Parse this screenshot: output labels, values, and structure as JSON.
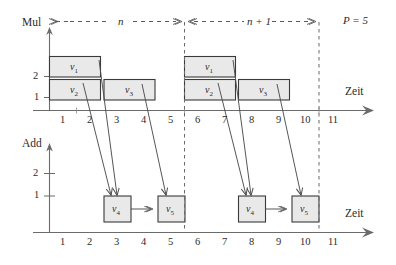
{
  "figure": {
    "title_annotation": "P = 5",
    "time_axis_label": "Zeit",
    "charts": [
      {
        "name": "mul",
        "axis_label": "Mul",
        "y_ticks": [
          "1",
          "2"
        ],
        "x_ticks": [
          "1",
          "2",
          "3",
          "4",
          "5",
          "6",
          "7",
          "8",
          "9",
          "10",
          "11"
        ],
        "blocks": [
          {
            "id": "v1a",
            "label": "v",
            "sub": "1",
            "start": 0,
            "end": 2,
            "row": 2
          },
          {
            "id": "v2a",
            "label": "v",
            "sub": "2",
            "start": 0,
            "end": 2,
            "row": 1
          },
          {
            "id": "v3a",
            "label": "v",
            "sub": "3",
            "start": 2,
            "end": 4,
            "row": 1
          },
          {
            "id": "v1b",
            "label": "v",
            "sub": "1",
            "start": 5,
            "end": 7,
            "row": 2
          },
          {
            "id": "v2b",
            "label": "v",
            "sub": "2",
            "start": 5,
            "end": 7,
            "row": 1
          },
          {
            "id": "v3b",
            "label": "v",
            "sub": "3",
            "start": 7,
            "end": 9,
            "row": 1
          }
        ]
      },
      {
        "name": "add",
        "axis_label": "Add",
        "y_ticks": [
          "1",
          "2"
        ],
        "x_ticks": [
          "1",
          "2",
          "3",
          "4",
          "5",
          "6",
          "7",
          "8",
          "9",
          "10",
          "11"
        ],
        "blocks": [
          {
            "id": "v4a",
            "label": "v",
            "sub": "4",
            "start": 2,
            "end": 3,
            "row": 1
          },
          {
            "id": "v5a",
            "label": "v",
            "sub": "5",
            "start": 4,
            "end": 5,
            "row": 1
          },
          {
            "id": "v4b",
            "label": "v",
            "sub": "4",
            "start": 7,
            "end": 8,
            "row": 1
          },
          {
            "id": "v5b",
            "label": "v",
            "sub": "5",
            "start": 9,
            "end": 10,
            "row": 1
          }
        ]
      }
    ],
    "phases": [
      {
        "id": "phase-n",
        "label": "n",
        "from": 0,
        "to": 5
      },
      {
        "id": "phase-n1",
        "label": "n + 1",
        "from": 5,
        "to": 10
      }
    ],
    "iteration_boundaries": [
      5,
      10
    ],
    "dependency_edges": [
      {
        "from": "v1a",
        "to": "v4a"
      },
      {
        "from": "v2a",
        "to": "v4a"
      },
      {
        "from": "v3a",
        "to": "v5a"
      },
      {
        "from": "v4a",
        "to": "v5a"
      },
      {
        "from": "v1b",
        "to": "v4b"
      },
      {
        "from": "v2b",
        "to": "v4b"
      },
      {
        "from": "v3b",
        "to": "v5b"
      },
      {
        "from": "v4b",
        "to": "v5b"
      }
    ],
    "colors": {
      "block_fill": "#e9e9e9",
      "block_stroke": "#3a3a3a",
      "axis": "#6b6b6b",
      "dashed": "#6b6b6b",
      "text": "#2b2b2b"
    }
  }
}
